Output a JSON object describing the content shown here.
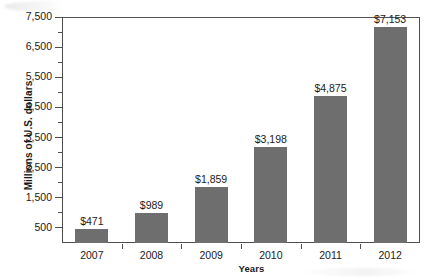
{
  "chart_data": {
    "type": "bar",
    "title": "",
    "xlabel": "Years",
    "ylabel": "Millions of U.S. dollars",
    "categories": [
      "2007",
      "2008",
      "2009",
      "2010",
      "2011",
      "2012"
    ],
    "values": [
      471,
      989,
      1859,
      3198,
      4875,
      7153
    ],
    "value_labels": [
      "$471",
      "$989",
      "$1,859",
      "$3,198",
      "$4,875",
      "$7,153"
    ],
    "ylim": [
      0,
      7500
    ],
    "ytick_labels": [
      "500",
      "1,500",
      "2,500",
      "3,500",
      "4,500",
      "5,500",
      "6,500",
      "7,500"
    ],
    "ytick_values": [
      500,
      1500,
      2500,
      3500,
      4500,
      5500,
      6500,
      7500
    ],
    "yminor_tick_values": [
      1000,
      2000,
      3000,
      4000,
      5000,
      6000,
      7000
    ],
    "grid": false,
    "legend": "none",
    "bar_color": "#6e6e6e",
    "axis_color": "#4d4d4d",
    "background_color": "#ffffff"
  }
}
